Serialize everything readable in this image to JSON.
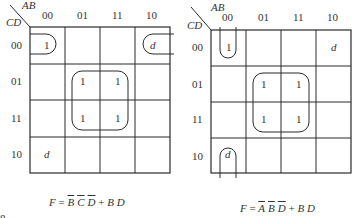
{
  "maps": [
    {
      "id": "left",
      "row_var": "CD",
      "col_var": "AB",
      "col_labels": [
        "00",
        "01",
        "11",
        "10"
      ],
      "row_labels": [
        "00",
        "01",
        "11",
        "10"
      ],
      "cells": [
        [
          "1",
          "",
          "",
          "d"
        ],
        [
          "",
          "1",
          "1",
          ""
        ],
        [
          "",
          "1",
          "1",
          ""
        ],
        [
          "d",
          "",
          "",
          ""
        ]
      ],
      "groups": [
        "wrap-around group of row 00: cell (00,00) with cell (00,10)",
        "quad group: rows 01-11, columns 01-11"
      ],
      "formula": {
        "lhs": "F",
        "eq": "=",
        "term1": [
          "B",
          "C",
          "D"
        ],
        "plus": "+",
        "term2": [
          "B",
          "D"
        ]
      }
    },
    {
      "id": "right",
      "row_var": "CD",
      "col_var": "AB",
      "col_labels": [
        "00",
        "01",
        "11",
        "10"
      ],
      "row_labels": [
        "00",
        "01",
        "11",
        "10"
      ],
      "cells": [
        [
          "1",
          "",
          "",
          "d"
        ],
        [
          "",
          "1",
          "1",
          ""
        ],
        [
          "",
          "1",
          "1",
          ""
        ],
        [
          "d",
          "",
          "",
          ""
        ]
      ],
      "groups": [
        "wrap-around group of column 00: cell (00,00) with cell (10,00)",
        "quad group: rows 01-11, columns 01-11"
      ],
      "formula": {
        "lhs": "F",
        "eq": "=",
        "term1": [
          "A",
          "B",
          "D"
        ],
        "plus": "+",
        "term2": [
          "B",
          "D"
        ]
      }
    }
  ],
  "page_marker": "8"
}
